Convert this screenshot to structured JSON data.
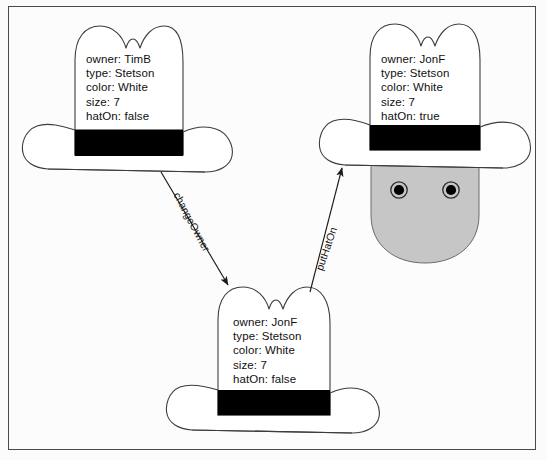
{
  "diagram": {
    "background_color": "#fcfcfc",
    "frame_color": "#4a4a4a",
    "stroke_color": "#3c3c3c",
    "hat_fill": "#ffffff",
    "hat_band_color": "#000000",
    "head_fill": "#c6c6c6",
    "eye_color": "#000000",
    "objects": [
      {
        "id": "hat-tim",
        "role": "source-hat",
        "position": "top-left",
        "attributes": [
          "owner: TimB",
          "type: Stetson",
          "color: White",
          "size: 7",
          "hatOn: false"
        ],
        "text_block": "owner: TimB\ntype: Stetson\ncolor: White\nsize: 7\nhatOn: false"
      },
      {
        "id": "hat-jon-worn",
        "role": "worn-hat",
        "position": "top-right",
        "attributes": [
          "owner: JonF",
          "type: Stetson",
          "color: White",
          "size: 7",
          "hatOn: true"
        ],
        "text_block": "owner: JonF\ntype: Stetson\ncolor: White\nsize: 7\nhatOn: true"
      },
      {
        "id": "hat-jon-off",
        "role": "owned-hat",
        "position": "bottom-center",
        "attributes": [
          "owner: JonF",
          "type: Stetson",
          "color: White",
          "size: 7",
          "hatOn: false"
        ],
        "text_block": "owner: JonF\ntype: Stetson\ncolor: White\nsize: 7\nhatOn: false"
      }
    ],
    "head": {
      "id": "head-figure",
      "eyes": 2,
      "fill": "#c6c6c6"
    },
    "transitions": [
      {
        "id": "changeOwner",
        "label": "changeOwner",
        "from": "hat-tim",
        "to": "hat-jon-off",
        "direction": "down-right"
      },
      {
        "id": "putHatOn",
        "label": "putHatOn",
        "from": "hat-jon-off",
        "to": "hat-jon-worn",
        "direction": "up-right"
      }
    ]
  }
}
